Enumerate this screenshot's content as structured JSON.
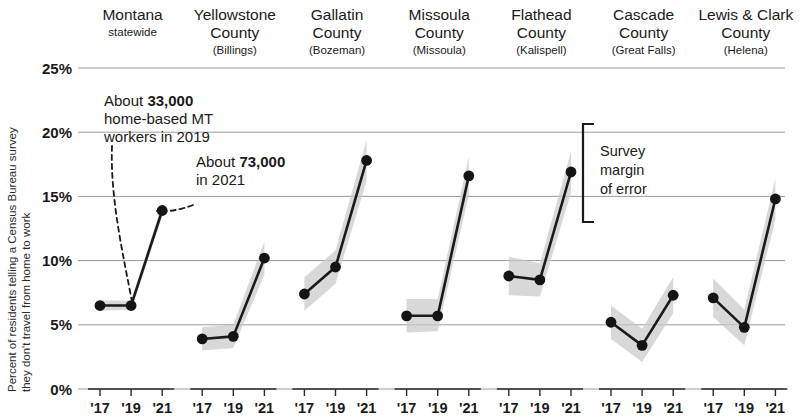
{
  "chart_data": {
    "type": "line",
    "title": "",
    "ylabel": "Percent of residents telling a Census Bureau survey they don't travel from home to work",
    "xlabel": "",
    "x": [
      "'17",
      "'19",
      "'21"
    ],
    "ylim": [
      0,
      25
    ],
    "yticks": [
      0,
      5,
      10,
      15,
      20,
      25
    ],
    "ytick_labels": [
      "0%",
      "5%",
      "10%",
      "15%",
      "20%",
      "25%"
    ],
    "grid": true,
    "legend": "none",
    "panels": [
      {
        "name": "Montana",
        "subtitle": "statewide",
        "place": "",
        "values": [
          6.5,
          6.5,
          13.9
        ],
        "band_low": [
          6.1,
          6.2,
          13.4
        ],
        "band_high": [
          6.9,
          6.9,
          14.4
        ]
      },
      {
        "name": "Yellowstone",
        "subtitle": "County",
        "place": "(Billings)",
        "values": [
          3.9,
          4.1,
          10.2
        ],
        "band_low": [
          3.0,
          3.2,
          8.9
        ],
        "band_high": [
          4.8,
          5.0,
          11.5
        ]
      },
      {
        "name": "Gallatin",
        "subtitle": "County",
        "place": "(Bozeman)",
        "values": [
          7.4,
          9.5,
          17.8
        ],
        "band_low": [
          6.1,
          8.2,
          16.2
        ],
        "band_high": [
          8.7,
          10.8,
          19.4
        ]
      },
      {
        "name": "Missoula",
        "subtitle": "County",
        "place": "(Missoula)",
        "values": [
          5.7,
          5.7,
          16.6
        ],
        "band_low": [
          4.4,
          4.5,
          15.1
        ],
        "band_high": [
          7.0,
          7.0,
          18.1
        ]
      },
      {
        "name": "Flathead",
        "subtitle": "County",
        "place": "(Kalispell)",
        "values": [
          8.8,
          8.5,
          16.9
        ],
        "band_low": [
          7.3,
          7.2,
          15.3
        ],
        "band_high": [
          10.3,
          9.8,
          18.5
        ]
      },
      {
        "name": "Cascade",
        "subtitle": "County",
        "place": "(Great Falls)",
        "values": [
          5.2,
          3.4,
          7.3
        ],
        "band_low": [
          3.9,
          2.1,
          5.9
        ],
        "band_high": [
          6.5,
          4.7,
          8.7
        ]
      },
      {
        "name": "Lewis & Clark",
        "subtitle": "County",
        "place": "(Helena)",
        "values": [
          7.1,
          4.8,
          14.8
        ],
        "band_low": [
          5.6,
          3.4,
          13.2
        ],
        "band_high": [
          8.6,
          6.2,
          16.4
        ]
      }
    ],
    "annotations": [
      {
        "id": "anno-2019",
        "line1_pre": "About ",
        "line1_bold": "33,000",
        "line2": "home-based MT",
        "line3": "workers in 2019"
      },
      {
        "id": "anno-2021",
        "line1_pre": "About ",
        "line1_bold": "73,000",
        "line2": "in 2021"
      },
      {
        "id": "margin-of-error",
        "line1": "Survey",
        "line2": "margin",
        "line3": "of error"
      }
    ],
    "colors": {
      "line": "#141414",
      "band": "#c9c9c9",
      "grid": "#9a9a9a",
      "text": "#1a1a1a",
      "background": "#ffffff"
    }
  }
}
